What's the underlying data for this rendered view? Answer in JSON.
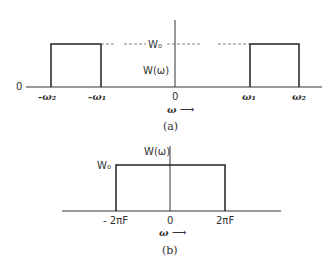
{
  "figure_a": {
    "caption": "(a)",
    "y_axis_label": "W(ω)",
    "level_label": "W₀",
    "origin_y_label": "0",
    "origin_x_label": "0",
    "x_axis_label": "ω ⟶",
    "ticks": [
      "-ω₂",
      "-ω₁",
      "ω₁",
      "ω₂"
    ],
    "bands": [
      {
        "from": "-ω₂",
        "to": "-ω₁",
        "level": "W₀"
      },
      {
        "from": "ω₁",
        "to": "ω₂",
        "level": "W₀"
      }
    ]
  },
  "figure_b": {
    "caption": "(b)",
    "y_axis_label": "W(ω)",
    "level_label": "W₀",
    "origin_x_label": "0",
    "x_axis_label": "ω ⟶",
    "ticks": [
      "- 2πF",
      "2πF"
    ],
    "bands": [
      {
        "from": "-2πF",
        "to": "2πF",
        "level": "W₀"
      }
    ]
  }
}
